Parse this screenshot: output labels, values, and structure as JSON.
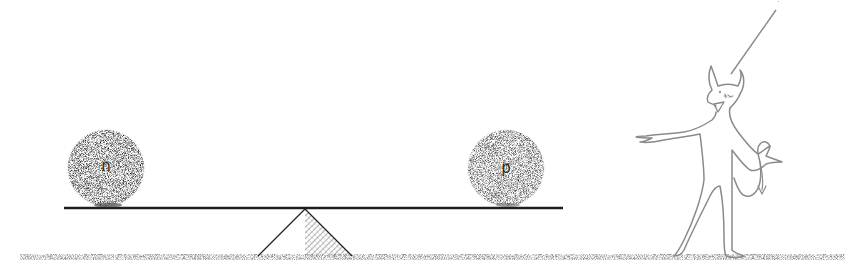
{
  "diagram": {
    "type": "seesaw-illustration",
    "balls": [
      {
        "label": "n",
        "side": "left",
        "cx": 106,
        "cy": 168,
        "r": 38
      },
      {
        "label": "p",
        "side": "right",
        "cx": 506,
        "cy": 168,
        "r": 38
      }
    ],
    "beam": {
      "x1": 64,
      "x2": 563,
      "y": 208
    },
    "fulcrum": {
      "apex_x": 305,
      "apex_y": 209,
      "base_left_x": 258,
      "base_right_x": 352,
      "base_y": 256
    },
    "ground": {
      "x1": 20,
      "x2": 845,
      "y": 257
    },
    "figure": "devil-character-gesturing",
    "pointer_line": {
      "x1": 776,
      "y1": 10,
      "x2": 731,
      "y2": 74
    },
    "colors": {
      "ink": "#222222",
      "figure_stroke": "#8a8a8a",
      "stipple": "#555555",
      "background": "#ffffff"
    }
  }
}
